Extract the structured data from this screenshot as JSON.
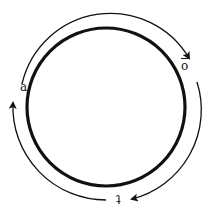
{
  "diagram": {
    "type": "cycle",
    "nodes": [
      {
        "id": "a",
        "label": "a",
        "position": "left"
      },
      {
        "id": "b",
        "label": "ō",
        "position": "upper-right"
      },
      {
        "id": "t",
        "label": "t",
        "position": "bottom"
      }
    ],
    "edges": [
      {
        "from": "a",
        "to": "b",
        "direction": "clockwise"
      },
      {
        "from": "b",
        "to": "t",
        "direction": "clockwise"
      },
      {
        "from": "t",
        "to": "a",
        "direction": "clockwise"
      }
    ],
    "colors": {
      "stroke": "#111111",
      "background": "#ffffff"
    }
  },
  "labels": {
    "a": "a",
    "b": "o",
    "t": "t"
  }
}
